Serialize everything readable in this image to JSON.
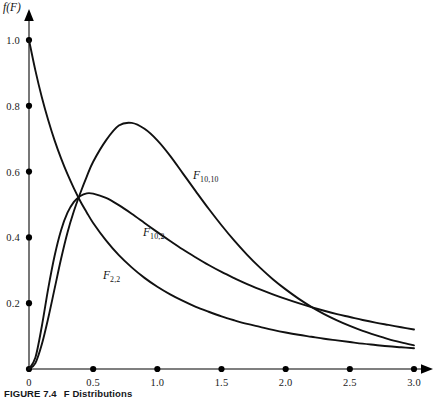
{
  "figure": {
    "caption_label": "FIGURE 7.4",
    "caption_text": "F Distributions",
    "y_axis_title": "f(F)",
    "x_axis_title": ""
  },
  "axes": {
    "x_ticks": [
      "0",
      "0.5",
      "1.0",
      "1.5",
      "2.0",
      "2.5",
      "3.0"
    ],
    "x_tick_values": [
      0,
      0.5,
      1.0,
      1.5,
      2.0,
      2.5,
      3.0
    ],
    "y_ticks": [
      "0.2",
      "0.4",
      "0.6",
      "0.8",
      "1.0"
    ],
    "y_tick_values": [
      0.2,
      0.4,
      0.6,
      0.8,
      1.0
    ]
  },
  "curve_labels": [
    {
      "name": "f-10-10-label",
      "base": "F",
      "sub": "10,10",
      "left": 193,
      "top": 169
    },
    {
      "name": "f-10-2-label",
      "base": "F",
      "sub": "10,2",
      "left": 143,
      "top": 226
    },
    {
      "name": "f-2-2-label",
      "base": "F",
      "sub": "2,2",
      "left": 103,
      "top": 269
    }
  ],
  "chart_data": {
    "type": "line",
    "title": "F Distributions",
    "xlabel": "F",
    "ylabel": "f(F)",
    "xlim": [
      0,
      3.0
    ],
    "ylim": [
      0,
      1.05
    ],
    "grid": false,
    "legend": "inline-curve-labels",
    "x": [
      0,
      0.05,
      0.1,
      0.15,
      0.2,
      0.25,
      0.3,
      0.35,
      0.4,
      0.45,
      0.5,
      0.6,
      0.7,
      0.8,
      0.9,
      1.0,
      1.1,
      1.2,
      1.3,
      1.4,
      1.5,
      1.6,
      1.7,
      1.8,
      1.9,
      2.0,
      2.1,
      2.2,
      2.3,
      2.4,
      2.5,
      2.6,
      2.7,
      2.8,
      2.9,
      3.0
    ],
    "series": [
      {
        "name": "F_10,10",
        "label": "F",
        "subscript": "10,10",
        "peak_x": 0.72,
        "peak_y": 0.75,
        "values": [
          0,
          0.018,
          0.075,
          0.155,
          0.245,
          0.335,
          0.415,
          0.48,
          0.535,
          0.585,
          0.63,
          0.695,
          0.74,
          0.748,
          0.73,
          0.695,
          0.648,
          0.594,
          0.54,
          0.487,
          0.437,
          0.39,
          0.347,
          0.308,
          0.273,
          0.242,
          0.214,
          0.189,
          0.167,
          0.148,
          0.131,
          0.116,
          0.103,
          0.091,
          0.081,
          0.072
        ]
      },
      {
        "name": "F_10,2",
        "label": "F",
        "subscript": "10,2",
        "peak_x": 0.46,
        "peak_y": 0.535,
        "values": [
          0,
          0.035,
          0.13,
          0.245,
          0.345,
          0.422,
          0.475,
          0.508,
          0.526,
          0.534,
          0.533,
          0.52,
          0.498,
          0.472,
          0.444,
          0.416,
          0.389,
          0.363,
          0.339,
          0.316,
          0.295,
          0.276,
          0.258,
          0.242,
          0.227,
          0.213,
          0.2,
          0.188,
          0.177,
          0.167,
          0.158,
          0.149,
          0.141,
          0.134,
          0.127,
          0.12
        ]
      },
      {
        "name": "F_2,2",
        "label": "F",
        "subscript": "2,2",
        "monotone": "decreasing",
        "start_y": 1.0,
        "values": [
          1.0,
          0.907,
          0.826,
          0.756,
          0.694,
          0.64,
          0.592,
          0.549,
          0.51,
          0.476,
          0.444,
          0.391,
          0.346,
          0.309,
          0.277,
          0.25,
          0.227,
          0.207,
          0.189,
          0.174,
          0.16,
          0.148,
          0.137,
          0.128,
          0.119,
          0.111,
          0.104,
          0.098,
          0.092,
          0.087,
          0.082,
          0.077,
          0.073,
          0.069,
          0.066,
          0.063
        ]
      }
    ]
  }
}
